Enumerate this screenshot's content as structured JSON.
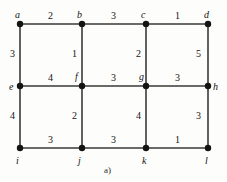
{
  "figure": {
    "caption": "a)",
    "caption_x": 104,
    "caption_y": 166,
    "background": "#fdfdfb",
    "edge_color": "#3a3a3a",
    "node_color": "#141414",
    "node_radius": 3.2,
    "edge_width": 1.6
  },
  "chart_data": {
    "type": "diagram",
    "subtype": "weighted-undirected-graph",
    "title": "a)",
    "xlabel": "",
    "ylabel": "",
    "grid": false,
    "legend": null,
    "layout": "3-row by 4-column rectangular lattice",
    "nodes": [
      {
        "id": "a",
        "label": "a",
        "x": 20,
        "y": 24,
        "label_x": 15,
        "label_y": 10
      },
      {
        "id": "b",
        "label": "b",
        "x": 82,
        "y": 24,
        "label_x": 77,
        "label_y": 10
      },
      {
        "id": "c",
        "label": "c",
        "x": 146,
        "y": 24,
        "label_x": 141,
        "label_y": 10
      },
      {
        "id": "d",
        "label": "d",
        "x": 208,
        "y": 24,
        "label_x": 204,
        "label_y": 10
      },
      {
        "id": "e",
        "label": "e",
        "x": 20,
        "y": 86,
        "label_x": 9,
        "label_y": 82
      },
      {
        "id": "f",
        "label": "f",
        "x": 82,
        "y": 86,
        "label_x": 75,
        "label_y": 72
      },
      {
        "id": "g",
        "label": "g",
        "x": 146,
        "y": 86,
        "label_x": 139,
        "label_y": 72
      },
      {
        "id": "h",
        "label": "h",
        "x": 208,
        "y": 86,
        "label_x": 213,
        "label_y": 82
      },
      {
        "id": "i",
        "label": "i",
        "x": 20,
        "y": 148,
        "label_x": 16,
        "label_y": 156
      },
      {
        "id": "j",
        "label": "j",
        "x": 82,
        "y": 148,
        "label_x": 78,
        "label_y": 156
      },
      {
        "id": "k",
        "label": "k",
        "x": 146,
        "y": 148,
        "label_x": 142,
        "label_y": 156
      },
      {
        "id": "l",
        "label": "l",
        "x": 208,
        "y": 148,
        "label_x": 205,
        "label_y": 156
      }
    ],
    "edges": [
      {
        "from": "a",
        "to": "b",
        "weight": 2,
        "orientation": "horizontal",
        "label_x": 48,
        "label_y": 11
      },
      {
        "from": "b",
        "to": "c",
        "weight": 3,
        "orientation": "horizontal",
        "label_x": 111,
        "label_y": 11
      },
      {
        "from": "c",
        "to": "d",
        "weight": 1,
        "orientation": "horizontal",
        "label_x": 175,
        "label_y": 11
      },
      {
        "from": "e",
        "to": "f",
        "weight": 4,
        "orientation": "horizontal",
        "label_x": 48,
        "label_y": 73
      },
      {
        "from": "f",
        "to": "g",
        "weight": 3,
        "orientation": "horizontal",
        "label_x": 111,
        "label_y": 73
      },
      {
        "from": "g",
        "to": "h",
        "weight": 3,
        "orientation": "horizontal",
        "label_x": 175,
        "label_y": 73
      },
      {
        "from": "i",
        "to": "j",
        "weight": 3,
        "orientation": "horizontal",
        "label_x": 48,
        "label_y": 135
      },
      {
        "from": "j",
        "to": "k",
        "weight": 3,
        "orientation": "horizontal",
        "label_x": 111,
        "label_y": 135
      },
      {
        "from": "k",
        "to": "l",
        "weight": 1,
        "orientation": "horizontal",
        "label_x": 175,
        "label_y": 135
      },
      {
        "from": "a",
        "to": "e",
        "weight": 3,
        "orientation": "vertical",
        "label_x": 10,
        "label_y": 49
      },
      {
        "from": "b",
        "to": "f",
        "weight": 1,
        "orientation": "vertical",
        "label_x": 72,
        "label_y": 49
      },
      {
        "from": "c",
        "to": "g",
        "weight": 2,
        "orientation": "vertical",
        "label_x": 136,
        "label_y": 49
      },
      {
        "from": "d",
        "to": "h",
        "weight": 5,
        "orientation": "vertical",
        "label_x": 196,
        "label_y": 49
      },
      {
        "from": "e",
        "to": "i",
        "weight": 4,
        "orientation": "vertical",
        "label_x": 10,
        "label_y": 111
      },
      {
        "from": "f",
        "to": "j",
        "weight": 2,
        "orientation": "vertical",
        "label_x": 72,
        "label_y": 111
      },
      {
        "from": "g",
        "to": "k",
        "weight": 4,
        "orientation": "vertical",
        "label_x": 136,
        "label_y": 111
      },
      {
        "from": "h",
        "to": "l",
        "weight": 3,
        "orientation": "vertical",
        "label_x": 196,
        "label_y": 111
      }
    ]
  }
}
